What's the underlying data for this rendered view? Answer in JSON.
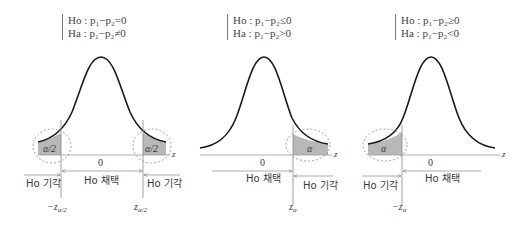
{
  "panels": [
    {
      "id": "two-tailed",
      "hypotheses": {
        "null": "Ho : p₁−p₂=0",
        "alt": "Ha : p₁−p₂≠0"
      },
      "rejection_label_left": "α/2",
      "rejection_label_right": "α/2",
      "center_label": "0",
      "accept_label": "Ho 채택",
      "reject_label_left": "Ho 기각",
      "reject_label_right": "Ho 기각",
      "critical_left": "−z",
      "critical_left_sub": "α/2",
      "critical_right": "z",
      "critical_right_sub": "α/2",
      "axis_label": "z"
    },
    {
      "id": "right-tailed",
      "hypotheses": {
        "null": "Ho : p₁−p₂≤0",
        "alt": "Ha : p₁−p₂>0"
      },
      "rejection_label": "α",
      "center_label": "0",
      "accept_label": "Ho 채택",
      "reject_label": "Ho 기각",
      "critical": "z",
      "critical_sub": "α",
      "axis_label": "z"
    },
    {
      "id": "left-tailed",
      "hypotheses": {
        "null": "Ho : p₁−p₂≥0",
        "alt": "Ha : p₁−p₂<0"
      },
      "rejection_label": "α",
      "center_label": "0",
      "accept_label": "Ho 채택",
      "reject_label": "Ho 기각",
      "critical": "−z",
      "critical_sub": "α",
      "axis_label": "z"
    }
  ],
  "colors": {
    "curve": "#1a1a1a",
    "rejection_fill": "#b8b8b8",
    "axis": "#888888",
    "dashed_circle": "#888888",
    "text": "#3a3a3a"
  }
}
